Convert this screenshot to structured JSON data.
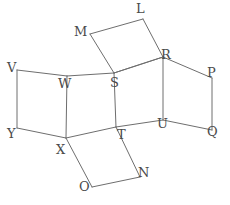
{
  "figure": {
    "canvas": {
      "width": 230,
      "height": 205
    },
    "style": {
      "background_color": "#ffffff",
      "stroke_color": "#6e6e6e",
      "label_color": "#4a4a4a",
      "stroke_width": 1,
      "label_font_size": 13
    },
    "vertices": [
      {
        "id": "L",
        "label": "L",
        "x": 143,
        "y": 19,
        "label_x": 136,
        "label_y": 2
      },
      {
        "id": "M",
        "label": "M",
        "x": 90,
        "y": 34,
        "label_x": 74,
        "label_y": 25
      },
      {
        "id": "V",
        "label": "V",
        "x": 17,
        "y": 70,
        "label_x": 7,
        "label_y": 61
      },
      {
        "id": "W",
        "label": "W",
        "x": 67,
        "y": 76,
        "label_x": 58,
        "label_y": 77
      },
      {
        "id": "S",
        "label": "S",
        "x": 114,
        "y": 73,
        "label_x": 110,
        "label_y": 76
      },
      {
        "id": "R",
        "label": "R",
        "x": 163,
        "y": 57,
        "label_x": 161,
        "label_y": 48
      },
      {
        "id": "P",
        "label": "P",
        "x": 212,
        "y": 78,
        "label_x": 207,
        "label_y": 66
      },
      {
        "id": "Y",
        "label": "Y",
        "x": 17,
        "y": 128,
        "label_x": 7,
        "label_y": 127
      },
      {
        "id": "X",
        "label": "X",
        "x": 66,
        "y": 138,
        "label_x": 56,
        "label_y": 143
      },
      {
        "id": "T",
        "label": "T",
        "x": 116,
        "y": 127,
        "label_x": 117,
        "label_y": 128
      },
      {
        "id": "U",
        "label": "U",
        "x": 163,
        "y": 120,
        "label_x": 157,
        "label_y": 117
      },
      {
        "id": "Q",
        "label": "Q",
        "x": 212,
        "y": 130,
        "label_x": 207,
        "label_y": 125
      },
      {
        "id": "N",
        "label": "N",
        "x": 140,
        "y": 177,
        "label_x": 138,
        "label_y": 166
      },
      {
        "id": "O",
        "label": "O",
        "x": 92,
        "y": 187,
        "label_x": 79,
        "label_y": 180
      }
    ],
    "edges": [
      {
        "from": "M",
        "to": "L",
        "name": "edge-M-L"
      },
      {
        "from": "L",
        "to": "R",
        "name": "edge-L-R"
      },
      {
        "from": "R",
        "to": "S",
        "name": "edge-R-S"
      },
      {
        "from": "S",
        "to": "M",
        "name": "edge-S-M"
      },
      {
        "from": "V",
        "to": "W",
        "name": "edge-V-W"
      },
      {
        "from": "W",
        "to": "X",
        "name": "edge-W-X"
      },
      {
        "from": "X",
        "to": "Y",
        "name": "edge-X-Y"
      },
      {
        "from": "Y",
        "to": "V",
        "name": "edge-Y-V"
      },
      {
        "from": "W",
        "to": "S",
        "name": "edge-W-S"
      },
      {
        "from": "S",
        "to": "T",
        "name": "edge-S-T"
      },
      {
        "from": "T",
        "to": "X",
        "name": "edge-T-X"
      },
      {
        "from": "S",
        "to": "R",
        "name": "edge-S-R-shared"
      },
      {
        "from": "R",
        "to": "U",
        "name": "edge-R-U"
      },
      {
        "from": "U",
        "to": "T",
        "name": "edge-U-T"
      },
      {
        "from": "R",
        "to": "P",
        "name": "edge-R-P"
      },
      {
        "from": "P",
        "to": "Q",
        "name": "edge-P-Q"
      },
      {
        "from": "Q",
        "to": "U",
        "name": "edge-Q-U"
      },
      {
        "from": "X",
        "to": "O",
        "name": "edge-X-O"
      },
      {
        "from": "O",
        "to": "N",
        "name": "edge-O-N"
      },
      {
        "from": "N",
        "to": "T",
        "name": "edge-N-T"
      }
    ],
    "rings": [
      {
        "name": "ring-top",
        "vertices": [
          "M",
          "L",
          "R",
          "S"
        ]
      },
      {
        "name": "ring-left",
        "vertices": [
          "V",
          "W",
          "X",
          "Y"
        ]
      },
      {
        "name": "ring-center-left",
        "vertices": [
          "W",
          "S",
          "T",
          "X"
        ]
      },
      {
        "name": "ring-center-right",
        "vertices": [
          "S",
          "R",
          "U",
          "T"
        ]
      },
      {
        "name": "ring-right",
        "vertices": [
          "R",
          "P",
          "Q",
          "U"
        ]
      },
      {
        "name": "ring-bottom",
        "vertices": [
          "X",
          "T",
          "N",
          "O"
        ]
      }
    ]
  }
}
